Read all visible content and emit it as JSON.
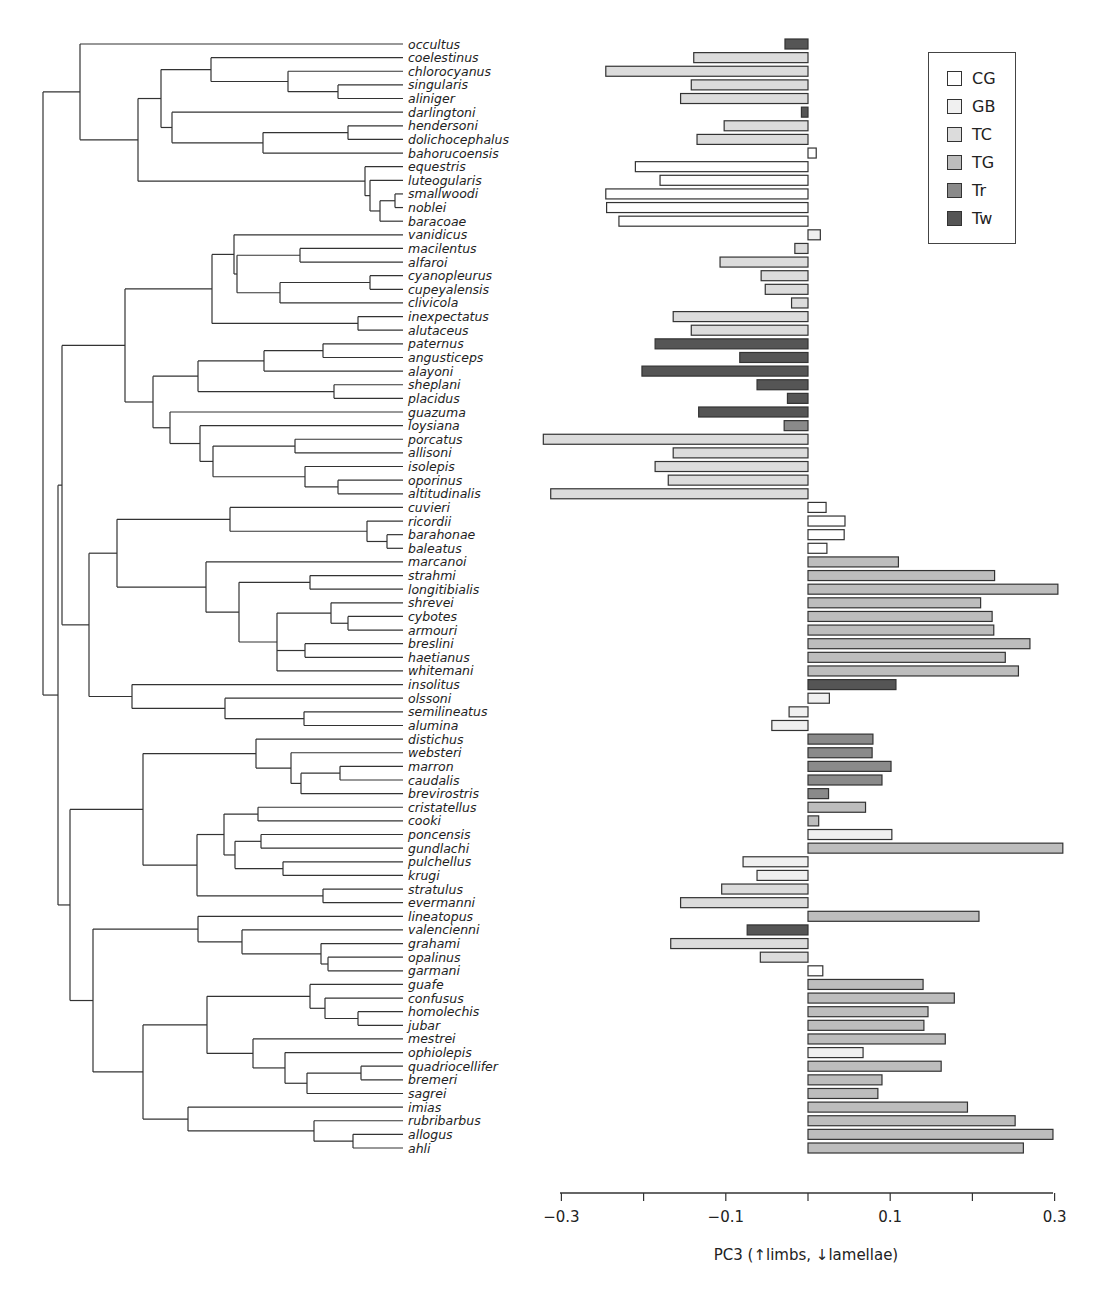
{
  "chart_data": {
    "type": "bar",
    "orientation": "horizontal",
    "title": "",
    "xlabel": "PC3 (↑limbs, ↓lamellae)",
    "ylabel": "",
    "xlim": [
      -0.3,
      0.3
    ],
    "xticks": [
      -0.3,
      -0.2,
      -0.1,
      0.0,
      0.1,
      0.2,
      0.3
    ],
    "xtick_labels": [
      "−0.3",
      "",
      "−0.1",
      "",
      "0.1",
      "",
      "0.3"
    ],
    "grid": false,
    "legend_position": "upper right",
    "legend": [
      {
        "key": "CG",
        "label": "CG",
        "color": "#ffffff"
      },
      {
        "key": "GB",
        "label": "GB",
        "color": "#f0f0f0"
      },
      {
        "key": "TC",
        "label": "TC",
        "color": "#dcdcdc"
      },
      {
        "key": "TG",
        "label": "TG",
        "color": "#bdbdbd"
      },
      {
        "key": "Tr",
        "label": "Tr",
        "color": "#8a8a8a"
      },
      {
        "key": "Tw",
        "label": "Tw",
        "color": "#555555"
      }
    ],
    "categories": [
      "occultus",
      "coelestinus",
      "chlorocyanus",
      "singularis",
      "aliniger",
      "darlingtoni",
      "hendersoni",
      "dolichocephalus",
      "bahorucoensis",
      "equestris",
      "luteogularis",
      "smallwoodi",
      "noblei",
      "baracoae",
      "vanidicus",
      "macilentus",
      "alfaroi",
      "cyanopleurus",
      "cupeyalensis",
      "clivicola",
      "inexpectatus",
      "alutaceus",
      "paternus",
      "angusticeps",
      "alayoni",
      "sheplani",
      "placidus",
      "guazuma",
      "loysiana",
      "porcatus",
      "allisoni",
      "isolepis",
      "oporinus",
      "altitudinalis",
      "cuvieri",
      "ricordii",
      "barahonae",
      "baleatus",
      "marcanoi",
      "strahmi",
      "longitibialis",
      "shrevei",
      "cybotes",
      "armouri",
      "breslini",
      "haetianus",
      "whitemani",
      "insolitus",
      "olssoni",
      "semilineatus",
      "alumina",
      "distichus",
      "websteri",
      "marron",
      "caudalis",
      "brevirostris",
      "cristatellus",
      "cooki",
      "poncensis",
      "gundlachi",
      "pulchellus",
      "krugi",
      "stratulus",
      "evermanni",
      "lineatopus",
      "valencienni",
      "grahami",
      "opalinus",
      "garmani",
      "guafe",
      "confusus",
      "homolechis",
      "jubar",
      "mestrei",
      "ophiolepis",
      "quadriocellifer",
      "bremeri",
      "sagrei",
      "imias",
      "rubribarbus",
      "allogus",
      "ahli"
    ],
    "values": [
      -0.028,
      -0.139,
      -0.246,
      -0.142,
      -0.155,
      -0.008,
      -0.102,
      -0.135,
      0.01,
      -0.21,
      -0.18,
      -0.246,
      -0.245,
      -0.23,
      0.015,
      -0.016,
      -0.107,
      -0.057,
      -0.052,
      -0.02,
      -0.164,
      -0.142,
      -0.186,
      -0.083,
      -0.202,
      -0.062,
      -0.025,
      -0.133,
      -0.029,
      -0.322,
      -0.164,
      -0.186,
      -0.17,
      -0.313,
      0.022,
      0.045,
      0.044,
      0.023,
      0.11,
      0.227,
      0.304,
      0.21,
      0.224,
      0.226,
      0.27,
      0.24,
      0.256,
      0.107,
      0.026,
      -0.023,
      -0.044,
      0.079,
      0.078,
      0.101,
      0.09,
      0.025,
      0.07,
      0.013,
      0.102,
      0.31,
      -0.079,
      -0.062,
      -0.105,
      -0.155,
      0.208,
      -0.074,
      -0.167,
      -0.058,
      0.018,
      0.14,
      0.178,
      0.146,
      0.141,
      0.167,
      0.067,
      0.162,
      0.09,
      0.085,
      0.194,
      0.252,
      0.298,
      0.262
    ],
    "groups": [
      "Tw",
      "TC",
      "TC",
      "TC",
      "TC",
      "Tw",
      "TC",
      "TC",
      "CG",
      "CG",
      "CG",
      "CG",
      "CG",
      "CG",
      "GB",
      "TC",
      "TC",
      "TC",
      "TC",
      "TC",
      "TC",
      "TC",
      "Tw",
      "Tw",
      "Tw",
      "Tw",
      "Tw",
      "Tw",
      "Tr",
      "TC",
      "TC",
      "TC",
      "TC",
      "TC",
      "CG",
      "CG",
      "CG",
      "CG",
      "TG",
      "TG",
      "TG",
      "TG",
      "TG",
      "TG",
      "TG",
      "TG",
      "TG",
      "Tw",
      "GB",
      "GB",
      "GB",
      "Tr",
      "Tr",
      "Tr",
      "Tr",
      "Tr",
      "TG",
      "TG",
      "GB",
      "TG",
      "GB",
      "GB",
      "TC",
      "TC",
      "TG",
      "Tw",
      "TC",
      "TC",
      "CG",
      "TG",
      "TG",
      "TG",
      "TG",
      "TG",
      "GB",
      "TG",
      "TG",
      "TG",
      "TG",
      "TG",
      "TG",
      "TG"
    ]
  },
  "tree": [
    43,
    [
      80,
      "occultus",
      [
        138,
        [
          161,
          [
            211,
            "coelestinus",
            [
              288,
              "chlorocyanus",
              [
                338,
                "singularis",
                "aliniger"
              ]
            ]
          ],
          [
            172,
            "darlingtoni",
            [
              263,
              [
                348,
                "hendersoni",
                "dolichocephalus"
              ],
              "bahorucoensis"
            ]
          ]
        ],
        [
          365,
          "equestris",
          [
            370,
            "luteogularis",
            [
              380,
              [
                395,
                "smallwoodi",
                "noblei"
              ],
              "baracoae"
            ]
          ]
        ]
      ]
    ],
    [
      58,
      [
        62,
        [
          125,
          [
            212,
            [
              234,
              "vanidicus",
              [
                237,
                [
                  300,
                  "macilentus",
                  "alfaroi"
                ],
                [
                  280,
                  [
                    370,
                    "cyanopleurus",
                    "cupeyalensis"
                  ],
                  "clivicola"
                ]
              ]
            ],
            [
              358,
              "inexpectatus",
              "alutaceus"
            ]
          ],
          [
            153,
            [
              198,
              [
                264,
                [
                  323,
                  "paternus",
                  "angusticeps"
                ],
                "alayoni"
              ],
              [
                334,
                "sheplani",
                "placidus"
              ]
            ],
            [
              170,
              "guazuma",
              [
                200,
                "loysiana",
                [
                  213,
                  [
                    295,
                    "porcatus",
                    "allisoni"
                  ],
                  [
                    305,
                    "isolepis",
                    [
                      338,
                      "oporinus",
                      "altitudinalis"
                    ]
                  ]
                ]
              ]
            ]
          ]
        ],
        [
          89,
          [
            117,
            [
              230,
              "cuvieri",
              [
                367,
                "ricordii",
                [
                  387,
                  "barahonae",
                  "baleatus"
                ]
              ]
            ],
            [
              206,
              "marcanoi",
              [
                239,
                [
                  310,
                  "strahmi",
                  "longitibialis"
                ],
                [
                  277,
                  [
                    331,
                    "shrevei",
                    [
                      348,
                      "cybotes",
                      "armouri"
                    ]
                  ],
                  [
                    305,
                    "breslini",
                    "haetianus"
                  ],
                  "whitemani"
                ]
              ]
            ]
          ],
          [
            132,
            "insolitus",
            [
              225,
              "olssoni",
              [
                304,
                "semilineatus",
                "alumina"
              ]
            ]
          ]
        ]
      ],
      [
        70,
        [
          143,
          [
            256,
            "distichus",
            [
              291,
              "websteri",
              [
                301,
                [
                  340,
                  "marron",
                  "caudalis"
                ],
                "brevirostris"
              ]
            ]
          ],
          [
            197,
            [
              224,
              [
                258,
                "cristatellus",
                "cooki"
              ],
              [
                235,
                [
                  261,
                  "poncensis",
                  "gundlachi"
                ],
                [
                  283,
                  "pulchellus",
                  "krugi"
                ]
              ]
            ],
            [
              323,
              "stratulus",
              "evermanni"
            ]
          ]
        ],
        [
          93,
          [
            198,
            "lineatopus",
            [
              242,
              "valencienni",
              [
                321,
                "grahami",
                [
                  328,
                  "opalinus",
                  "garmani"
                ]
              ]
            ]
          ],
          [
            143,
            [
              207,
              [
                310,
                "guafe",
                [
                  325,
                  "confusus",
                  [
                    358,
                    "homolechis",
                    "jubar"
                  ]
                ]
              ],
              [
                253,
                "mestrei",
                [
                  285,
                  "ophiolepis",
                  [
                    307,
                    [
                      361,
                      "quadriocellifer",
                      "bremeri"
                    ],
                    "sagrei"
                  ]
                ]
              ]
            ],
            [
              188,
              "imias",
              [
                314,
                "rubribarbus",
                [
                  353,
                  "allogus",
                  "ahli"
                ]
              ]
            ]
          ]
        ]
      ]
    ]
  ],
  "legend_labels": {
    "cg": "CG",
    "gb": "GB",
    "tc": "TC",
    "tg": "TG",
    "tr": "Tr",
    "tw": "Tw"
  }
}
